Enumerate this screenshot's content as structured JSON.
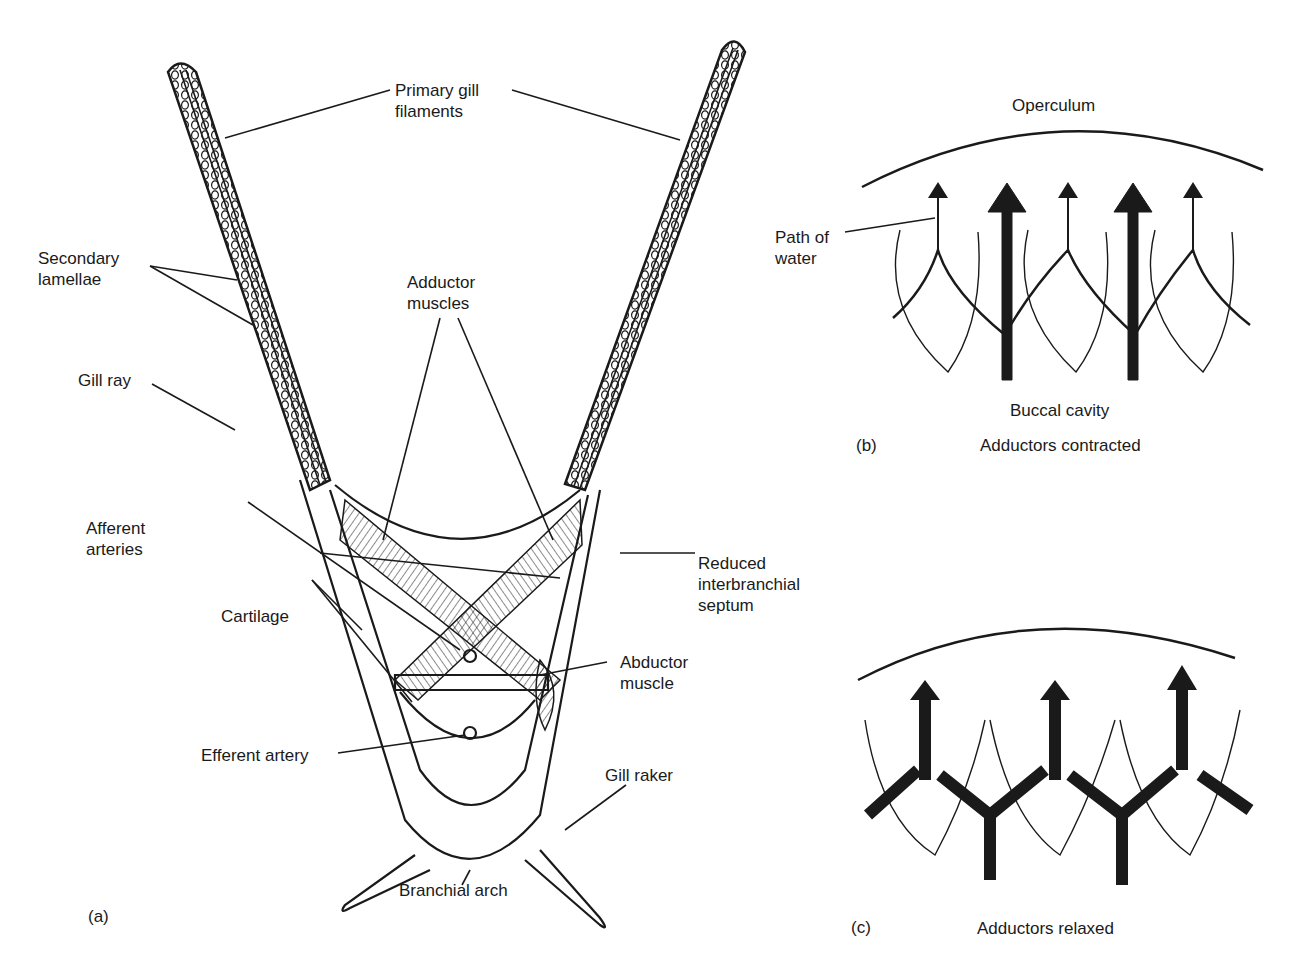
{
  "figure": {
    "panel_a": {
      "letter": "(a)",
      "labels": {
        "primary_gill_filaments": "Primary gill\nfilaments",
        "secondary_lamellae": "Secondary\nlamellae",
        "gill_ray": "Gill ray",
        "adductor_muscles": "Adductor\nmuscles",
        "afferent_arteries": "Afferent\narteries",
        "reduced_septum": "Reduced\ninterbranchial\nseptum",
        "cartilage": "Cartilage",
        "abductor_muscle": "Abductor\nmuscle",
        "efferent_artery": "Efferent artery",
        "gill_raker": "Gill raker",
        "branchial_arch": "Branchial arch"
      }
    },
    "panel_b": {
      "letter": "(b)",
      "operculum": "Operculum",
      "path_of_water": "Path of\nwater",
      "buccal_cavity": "Buccal cavity",
      "caption": "Adductors contracted"
    },
    "panel_c": {
      "letter": "(c)",
      "caption": "Adductors relaxed"
    }
  },
  "colors": {
    "ink": "#1a1a1a",
    "background": "#ffffff"
  }
}
